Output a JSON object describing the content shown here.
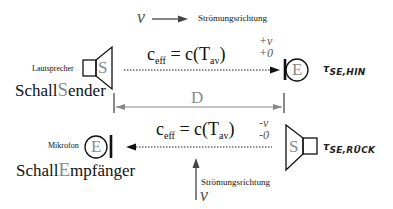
{
  "diagram": {
    "top_flow": {
      "symbol": "v",
      "label": "Strömungsrichtung"
    },
    "bottom_flow": {
      "symbol": "v",
      "label": "Strömungsrichtung"
    },
    "sender": {
      "device_label": "Lautsprecher",
      "name_prefix": "Schall",
      "name_highlight": "S",
      "name_suffix": "ender",
      "glyph": "S"
    },
    "receiver": {
      "device_label": "Mikrofon",
      "name_prefix": "Schall",
      "name_highlight": "E",
      "name_suffix": "mpfänger",
      "glyph": "E"
    },
    "forward": {
      "lhs": "c",
      "lhs_sub": "eff",
      "eq": "=",
      "rhs": "c(T",
      "rhs_sub": "av",
      "rhs_close": ")",
      "sign_top": "+v",
      "sign_bottom": "+0",
      "tau": "τ",
      "tau_sub": "SE,HIN",
      "receiver_glyph": "E"
    },
    "backward": {
      "lhs": "c",
      "lhs_sub": "eff",
      "eq": "=",
      "rhs": "c(T",
      "rhs_sub": "av",
      "rhs_close": ")",
      "sign_top": "-v",
      "sign_bottom": "-0",
      "tau": "τ",
      "tau_sub": "SE,RÜCK",
      "sender_glyph": "S"
    },
    "distance": {
      "label": "D"
    },
    "colors": {
      "line": "#111111",
      "gray": "#8a8a8a",
      "dim": "#777777"
    }
  }
}
